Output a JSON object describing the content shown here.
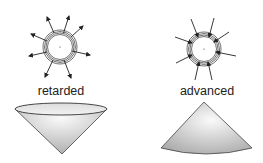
{
  "panels": [
    {
      "id": "left",
      "label": "retarded",
      "arrows_direction": "outward",
      "shape": "cone-apex-down"
    },
    {
      "id": "right",
      "label": "advanced",
      "arrows_direction": "inward",
      "shape": "cone-apex-up"
    }
  ],
  "colors": {
    "stroke": "#333333",
    "cone_light": "#f4f4f4",
    "cone_dark": "#b5b5b5",
    "text": "#222222"
  }
}
